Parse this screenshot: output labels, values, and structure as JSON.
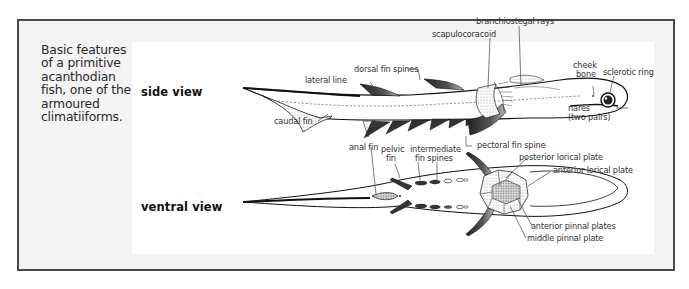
{
  "caption": "Basic features of a primitive acanthodian fish, one of the armoured climatiiforms.",
  "views": {
    "side": "side view",
    "ventral": "ventral view"
  },
  "labels": {
    "branchiostegal_rays": "branchiostegal rays",
    "scapulocoracoid": "scapulocoracoid",
    "dorsal_fin_spines": "dorsal fin spines",
    "lateral_line": "lateral line",
    "cheek_bone_1": "cheek",
    "cheek_bone_2": "bone",
    "sclerotic_ring": "sclerotic ring",
    "nares_1": "nares",
    "nares_2": "(two pairs)",
    "caudal_fin": "caudal fin",
    "pectoral_fin_spine": "pectoral fin spine",
    "anal_fin": "anal fin",
    "pelvic_fin_1": "pelvic",
    "pelvic_fin_2": "fin",
    "intermediate_fin_spines_1": "intermediate",
    "intermediate_fin_spines_2": "fin spines",
    "posterior_lorical_plate": "posterior lorical plate",
    "anterior_lorical_plate": "anterior lorical plate",
    "anterior_pinnal_plates": "anterior pinnal plates",
    "middle_pinnal_plate": "middle pinnal plate"
  },
  "colors": {
    "frame_border": "#4a4a4a",
    "frame_bg": "#f4f4f4",
    "panel_bg": "#ffffff",
    "ink": "#1a1a1a"
  }
}
